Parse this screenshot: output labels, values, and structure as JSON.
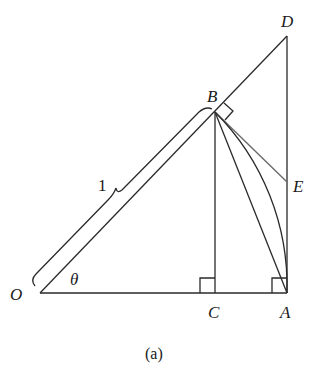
{
  "diagram": {
    "caption": "(a)",
    "points": {
      "O": {
        "label": "O",
        "x": 40,
        "y": 293
      },
      "C": {
        "label": "C",
        "x": 215,
        "y": 293
      },
      "A": {
        "label": "A",
        "x": 287,
        "y": 293
      },
      "B": {
        "label": "B",
        "x": 215,
        "y": 112
      },
      "D": {
        "label": "D",
        "x": 287,
        "y": 36
      },
      "E": {
        "label": "E",
        "x": 287,
        "y": 182
      }
    },
    "angle_label": "θ",
    "length_label": "1",
    "segments": [
      "OA",
      "OD",
      "BC",
      "DA",
      "BA",
      "BE"
    ],
    "arc": "BA (circular arc centered at O)",
    "right_angles": [
      "C",
      "A",
      "B"
    ],
    "colors": {
      "line": "#2a2a2a",
      "secondary_line": "#6a6a6a",
      "background": "#ffffff"
    }
  }
}
